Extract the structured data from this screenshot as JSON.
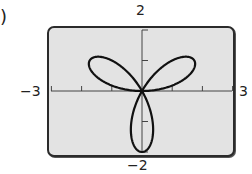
{
  "figure": {
    "label_fragment": ")"
  },
  "axes": {
    "x_min_label": "−3",
    "x_max_label": "3",
    "y_max_label": "2",
    "y_min_label": "−2"
  },
  "colors": {
    "background": "#ffffff",
    "plot_fill": "#e3e3e3",
    "frame": "#2b2b2b",
    "curve": "#111111",
    "axis": "#444444"
  },
  "chart_data": {
    "type": "line",
    "title": "",
    "equation": "r = 2sin(3θ)",
    "xlabel": "",
    "ylabel": "",
    "xlim": [
      -3,
      3
    ],
    "ylim": [
      -2,
      2
    ],
    "x_ticks": [
      -3,
      -2,
      -1,
      0,
      1,
      2,
      3
    ],
    "y_ticks": [
      -2,
      -1,
      0,
      1,
      2
    ],
    "tick_labels_shown": {
      "x": [
        "-3",
        "3"
      ],
      "y": [
        "2",
        "-2"
      ]
    },
    "grid": false,
    "petals": [
      {
        "angle_deg": 30,
        "tip": [
          1.732,
          1.0
        ]
      },
      {
        "angle_deg": 150,
        "tip": [
          -1.732,
          1.0
        ]
      },
      {
        "angle_deg": 270,
        "tip": [
          0,
          -2.0
        ]
      }
    ],
    "series": [
      {
        "name": "r = 2sin(3θ)",
        "theta_range_deg": [
          0,
          180
        ],
        "points": [
          [
            0.0,
            0.0
          ],
          [
            0.447,
            0.081
          ],
          [
            0.857,
            0.312
          ],
          [
            1.212,
            0.7
          ],
          [
            1.497,
            1.113
          ],
          [
            1.69,
            1.365
          ],
          [
            1.732,
            1.0
          ],
          [
            1.606,
            0.584
          ],
          [
            1.283,
            0.226
          ],
          [
            0.866,
            -0.0
          ],
          [
            0.433,
            -0.075
          ],
          [
            0.0,
            0.0
          ],
          [
            -0.433,
            -0.075
          ],
          [
            -0.866,
            0.0
          ],
          [
            -1.283,
            0.226
          ],
          [
            -1.606,
            0.584
          ],
          [
            -1.732,
            1.0
          ],
          [
            -1.69,
            1.365
          ],
          [
            -1.497,
            1.113
          ],
          [
            -1.212,
            0.7
          ],
          [
            -0.857,
            0.312
          ],
          [
            -0.447,
            0.081
          ],
          [
            0.0,
            0.0
          ],
          [
            0.0,
            -2.0
          ]
        ]
      }
    ]
  }
}
